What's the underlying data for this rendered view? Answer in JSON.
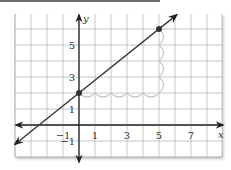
{
  "chart_data": {
    "type": "line",
    "title": "",
    "xlabel": "x",
    "ylabel": "y",
    "xlim": [
      -4,
      8.8
    ],
    "ylim": [
      -2,
      7
    ],
    "grid": true,
    "x_ticks": [
      -1,
      1,
      3,
      5,
      7
    ],
    "y_ticks": [
      -1,
      1,
      3,
      5
    ],
    "x_tick_labels": [
      "−1",
      "1",
      "3",
      "5",
      "7"
    ],
    "y_tick_labels": [
      "−1",
      "1",
      "3",
      "5"
    ],
    "series": [
      {
        "name": "line",
        "equation": "y = 0.8x + 2",
        "slope": 0.8,
        "intercept": 2,
        "x_range": [
          -4,
          6.1
        ],
        "color": "#3a3a3a"
      }
    ],
    "points": [
      {
        "x": 0,
        "y": 2,
        "label": ""
      },
      {
        "x": 5,
        "y": 6,
        "label": ""
      }
    ],
    "slope_annotation": {
      "run": {
        "from": [
          0,
          2
        ],
        "to": [
          5,
          2
        ],
        "value": 5
      },
      "rise": {
        "from": [
          5,
          2
        ],
        "to": [
          5,
          6
        ],
        "value": 4
      },
      "color": "#c8c8c8"
    }
  }
}
